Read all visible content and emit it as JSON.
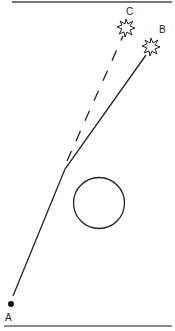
{
  "diagram": {
    "points": {
      "A": {
        "label": "A"
      },
      "B": {
        "label": "B"
      },
      "C": {
        "label": "C"
      }
    },
    "paths": [
      {
        "name": "actual-path",
        "from": "A",
        "to": "B",
        "style": "solid"
      },
      {
        "name": "extrapolated-path",
        "from": "bend",
        "to": "C",
        "style": "dashed"
      }
    ],
    "obstacle": "circle",
    "colors": {
      "stroke": "#222222",
      "border": "#666666"
    }
  }
}
